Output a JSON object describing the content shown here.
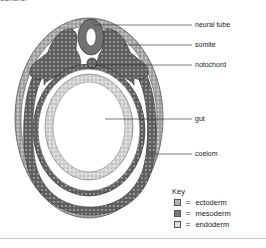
{
  "caption_fragment": "ochord.",
  "labels": {
    "neural_tube": "neural tube",
    "somite": "somite",
    "notochord": "notochord",
    "gut": "gut",
    "coelom": "coelom"
  },
  "key": {
    "title": "Key",
    "entries": [
      {
        "symbol": "=",
        "label": "ectoderm",
        "color": "#b4b4b4"
      },
      {
        "symbol": "=",
        "label": "mesoderm",
        "color": "#7a7a7a"
      },
      {
        "symbol": "=",
        "label": "endoderm",
        "color": "#dcdcdc"
      }
    ]
  },
  "colors": {
    "ectoderm": "#b4b4b4",
    "mesoderm": "#6f6f6f",
    "endoderm": "#dadada",
    "outline": "#444444"
  }
}
